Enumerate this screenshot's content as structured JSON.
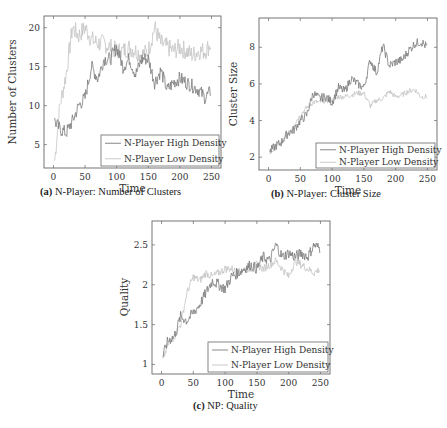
{
  "colors": {
    "high": "#7a7a7a",
    "low": "#c4c4c4",
    "axis": "#666666"
  },
  "legend": {
    "high": "N-Player High Density",
    "low": "N-Player Low Density"
  },
  "captions": [
    {
      "label": "(a)",
      "text": "N-Player: Number of Clusters"
    },
    {
      "label": "(b)",
      "text": "N-Player: Cluster Size"
    },
    {
      "label": "(c)",
      "text": "NP: Quality"
    }
  ],
  "chart_data": [
    {
      "type": "line",
      "title": "(a) N-Player: Number of Clusters",
      "xlabel": "Time",
      "ylabel": "Number of Clusters",
      "xlim": [
        -15,
        265
      ],
      "ylim": [
        2,
        21.5
      ],
      "xticks": [
        0,
        50,
        100,
        150,
        200,
        250
      ],
      "yticks": [
        5,
        10,
        15,
        20
      ],
      "grid": false,
      "legend_position": "lower right",
      "series": [
        {
          "name": "N-Player High Density",
          "x": [
            2,
            10,
            20,
            30,
            40,
            50,
            60,
            70,
            80,
            90,
            100,
            110,
            120,
            130,
            140,
            150,
            160,
            170,
            180,
            190,
            200,
            210,
            220,
            230,
            240,
            250
          ],
          "values": [
            8,
            7,
            6.5,
            8,
            10,
            11,
            15,
            13.5,
            16,
            16,
            17.5,
            15,
            16,
            14,
            16,
            16,
            13,
            14.5,
            12,
            13,
            13.5,
            13,
            12.5,
            12,
            11,
            12
          ]
        },
        {
          "name": "N-Player Low Density",
          "x": [
            2,
            10,
            20,
            30,
            40,
            50,
            60,
            70,
            80,
            90,
            100,
            110,
            120,
            130,
            140,
            150,
            160,
            170,
            180,
            190,
            200,
            210,
            220,
            230,
            240,
            250
          ],
          "values": [
            3,
            10,
            14,
            20,
            19,
            20,
            18.5,
            18,
            18,
            17.5,
            17,
            17,
            17.5,
            17,
            16.5,
            17,
            20,
            18,
            17.5,
            17,
            17.5,
            17,
            16.5,
            17,
            17,
            18
          ]
        }
      ]
    },
    {
      "type": "line",
      "title": "(b) N-Player: Cluster Size",
      "xlabel": "Time",
      "ylabel": "Cluster Size",
      "xlim": [
        -15,
        265
      ],
      "ylim": [
        1.3,
        9.6
      ],
      "xticks": [
        0,
        50,
        100,
        150,
        200,
        250
      ],
      "yticks": [
        2,
        4,
        6,
        8
      ],
      "grid": false,
      "legend_position": "lower right",
      "series": [
        {
          "name": "N-Player High Density",
          "x": [
            2,
            10,
            20,
            30,
            40,
            50,
            60,
            70,
            80,
            90,
            100,
            110,
            120,
            130,
            140,
            150,
            160,
            170,
            180,
            190,
            200,
            210,
            220,
            230,
            240,
            250
          ],
          "values": [
            2.3,
            2.6,
            2.8,
            3.3,
            3.5,
            4,
            4.3,
            5.5,
            5.2,
            5.3,
            5,
            5.8,
            5.6,
            6.3,
            6,
            5.8,
            7.3,
            6.6,
            8.1,
            7,
            7.2,
            7.3,
            7.8,
            8.2,
            8.3,
            8
          ],
          "note": "peak ~9.2 at t≈240"
        },
        {
          "name": "N-Player Low Density",
          "x": [
            2,
            10,
            20,
            30,
            40,
            50,
            60,
            70,
            80,
            90,
            100,
            110,
            120,
            130,
            140,
            150,
            160,
            170,
            180,
            190,
            200,
            210,
            220,
            230,
            240,
            250
          ],
          "values": [
            2.2,
            2.5,
            2.8,
            3.2,
            3.8,
            4.3,
            4.7,
            5,
            5,
            5.1,
            5.1,
            5.3,
            5.3,
            5.4,
            5.5,
            5.5,
            4.8,
            5.1,
            5.2,
            5.6,
            5.3,
            5.4,
            5.6,
            5.7,
            5.3,
            5.3
          ]
        }
      ]
    },
    {
      "type": "line",
      "title": "(c) NP: Quality",
      "xlabel": "Time",
      "ylabel": "Quality",
      "xlim": [
        -15,
        265
      ],
      "ylim": [
        0.88,
        2.8
      ],
      "xticks": [
        0,
        50,
        100,
        150,
        200,
        250
      ],
      "yticks": [
        1,
        1.5,
        2,
        2.5
      ],
      "grid": false,
      "legend_position": "lower right",
      "series": [
        {
          "name": "N-Player High Density",
          "x": [
            2,
            10,
            20,
            30,
            40,
            50,
            60,
            70,
            80,
            90,
            100,
            110,
            120,
            130,
            140,
            150,
            160,
            170,
            180,
            190,
            200,
            210,
            220,
            230,
            240,
            250
          ],
          "values": [
            1.1,
            1.3,
            1.35,
            1.6,
            1.55,
            1.65,
            1.75,
            1.9,
            2.05,
            2,
            1.95,
            2.1,
            2.15,
            2.2,
            2.25,
            2.2,
            2.35,
            2.3,
            2.5,
            2.35,
            2.4,
            2.35,
            2.4,
            2.35,
            2.5,
            2.45
          ]
        },
        {
          "name": "N-Player Low Density",
          "x": [
            2,
            10,
            20,
            30,
            40,
            50,
            60,
            70,
            80,
            90,
            100,
            110,
            120,
            130,
            140,
            150,
            160,
            170,
            180,
            190,
            200,
            210,
            220,
            230,
            240,
            250
          ],
          "values": [
            1.05,
            1.25,
            1.35,
            1.5,
            1.9,
            2.1,
            2.05,
            2.15,
            2.1,
            2.15,
            2.2,
            2.2,
            2.15,
            2.2,
            2.2,
            2.25,
            2.2,
            2.25,
            2.3,
            2.2,
            2.1,
            2.3,
            2.25,
            2.2,
            2.15,
            2.2
          ]
        }
      ]
    }
  ]
}
